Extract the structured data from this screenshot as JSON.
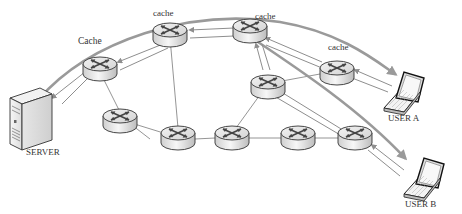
{
  "labels": {
    "server": "SERVER",
    "user_a": "USER A",
    "user_b": "USER B",
    "cache_left": "Cache",
    "cache_top": "cache",
    "cache_top_right": "cache",
    "cache_right": "cache"
  },
  "nodes": [
    {
      "id": "server",
      "type": "server",
      "label": "SERVER"
    },
    {
      "id": "r1",
      "type": "router",
      "label": "Cache",
      "cached": true
    },
    {
      "id": "r2",
      "type": "router",
      "label": "cache",
      "cached": true
    },
    {
      "id": "r3",
      "type": "router",
      "label": "cache",
      "cached": true
    },
    {
      "id": "r4",
      "type": "router",
      "label": "cache",
      "cached": true
    },
    {
      "id": "r5",
      "type": "router",
      "cached": false
    },
    {
      "id": "r6",
      "type": "router",
      "cached": false
    },
    {
      "id": "r7",
      "type": "router",
      "cached": false
    },
    {
      "id": "r8",
      "type": "router",
      "cached": false
    },
    {
      "id": "r9",
      "type": "router",
      "cached": false
    },
    {
      "id": "r10",
      "type": "router",
      "cached": false
    },
    {
      "id": "user_a",
      "type": "laptop",
      "label": "USER A"
    },
    {
      "id": "user_b",
      "type": "laptop",
      "label": "USER B"
    }
  ],
  "edges": [
    [
      "r1",
      "r6"
    ],
    [
      "r6",
      "r7"
    ],
    [
      "r2",
      "r7"
    ],
    [
      "r7",
      "r8"
    ],
    [
      "r8",
      "r5"
    ],
    [
      "r5",
      "r4"
    ],
    [
      "r8",
      "r9"
    ],
    [
      "r9",
      "r10"
    ],
    [
      "r3",
      "r5"
    ]
  ],
  "colors": {
    "path": "#9a9a9a",
    "link": "#7a7a7a",
    "text": "#333333"
  }
}
